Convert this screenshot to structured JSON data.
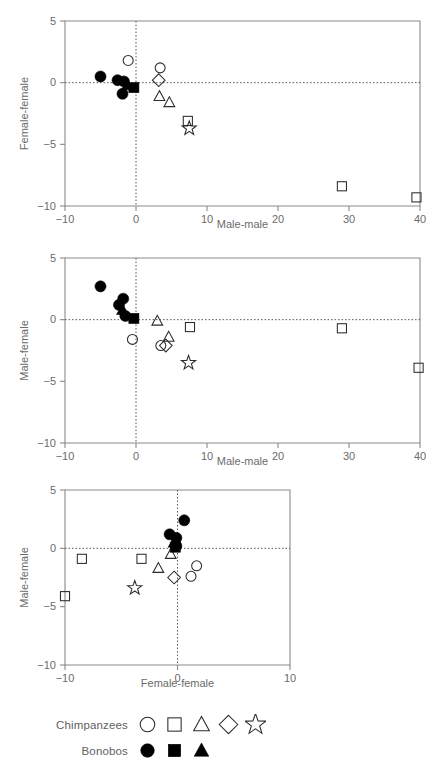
{
  "figure": {
    "axis_ranges": {
      "wide_x": [
        -10,
        40
      ],
      "narrow_x": [
        -10,
        10
      ],
      "y": [
        -10,
        5
      ]
    },
    "wide_x_ticks": [
      "-10",
      "0",
      "10",
      "20",
      "30",
      "40"
    ],
    "narrow_x_ticks": [
      "-10",
      "0",
      "10"
    ],
    "y_ticks": [
      "5",
      "0",
      "-5",
      "-10"
    ],
    "reference_value": "0"
  },
  "legend": {
    "rows": [
      {
        "label": "Chimpanzees",
        "symbols": [
          "open-circle",
          "open-square",
          "open-triangle",
          "open-diamond",
          "open-star"
        ]
      },
      {
        "label": "Bonobos",
        "symbols": [
          "filled-circle",
          "filled-square",
          "filled-triangle"
        ]
      }
    ]
  },
  "chart_data": [
    {
      "type": "scatter",
      "title": "",
      "xlabel": "Male-male",
      "ylabel": "Female-female",
      "xlim": [
        -10,
        40
      ],
      "ylim": [
        -10,
        5
      ],
      "grid": false,
      "reference_lines": {
        "x": 0,
        "y": 0,
        "style": "dotted"
      },
      "legend_position": "figure-bottom",
      "series": [
        {
          "name": "Chimpanzees",
          "marker": "open-circle",
          "points": [
            [
              -1.1,
              1.8
            ],
            [
              3.4,
              1.2
            ]
          ]
        },
        {
          "name": "Chimpanzees",
          "marker": "open-square",
          "points": [
            [
              7.3,
              -3.1
            ],
            [
              29.0,
              -8.4
            ],
            [
              39.5,
              -9.3
            ]
          ]
        },
        {
          "name": "Chimpanzees",
          "marker": "open-triangle",
          "points": [
            [
              3.3,
              -1.1
            ],
            [
              4.7,
              -1.6
            ]
          ]
        },
        {
          "name": "Chimpanzees",
          "marker": "open-diamond",
          "points": [
            [
              3.2,
              0.2
            ]
          ]
        },
        {
          "name": "Chimpanzees",
          "marker": "open-star",
          "points": [
            [
              7.5,
              -3.7
            ]
          ]
        },
        {
          "name": "Bonobos",
          "marker": "filled-circle",
          "points": [
            [
              -5.0,
              0.5
            ],
            [
              -2.6,
              0.2
            ],
            [
              -1.7,
              0.1
            ],
            [
              -1.9,
              -0.9
            ]
          ]
        },
        {
          "name": "Bonobos",
          "marker": "filled-square",
          "points": [
            [
              -0.3,
              -0.4
            ]
          ]
        },
        {
          "name": "Bonobos",
          "marker": "filled-triangle",
          "points": [
            [
              -1.2,
              -0.2
            ]
          ]
        }
      ]
    },
    {
      "type": "scatter",
      "title": "",
      "xlabel": "Male-male",
      "ylabel": "Male-female",
      "xlim": [
        -10,
        40
      ],
      "ylim": [
        -10,
        5
      ],
      "grid": false,
      "reference_lines": {
        "x": 0,
        "y": 0,
        "style": "dotted"
      },
      "legend_position": "figure-bottom",
      "series": [
        {
          "name": "Chimpanzees",
          "marker": "open-circle",
          "points": [
            [
              -0.5,
              -1.6
            ],
            [
              3.5,
              -2.1
            ]
          ]
        },
        {
          "name": "Chimpanzees",
          "marker": "open-square",
          "points": [
            [
              7.6,
              -0.6
            ],
            [
              29.0,
              -0.7
            ],
            [
              39.8,
              -3.9
            ]
          ]
        },
        {
          "name": "Chimpanzees",
          "marker": "open-triangle",
          "points": [
            [
              3.0,
              -0.1
            ],
            [
              4.6,
              -1.4
            ]
          ]
        },
        {
          "name": "Chimpanzees",
          "marker": "open-diamond",
          "points": [
            [
              4.2,
              -2.1
            ]
          ]
        },
        {
          "name": "Chimpanzees",
          "marker": "open-star",
          "points": [
            [
              7.4,
              -3.5
            ]
          ]
        },
        {
          "name": "Bonobos",
          "marker": "filled-circle",
          "points": [
            [
              -5.0,
              2.7
            ],
            [
              -2.4,
              1.2
            ],
            [
              -1.8,
              1.7
            ],
            [
              -1.5,
              0.3
            ]
          ]
        },
        {
          "name": "Bonobos",
          "marker": "filled-square",
          "points": [
            [
              -0.3,
              0.1
            ]
          ]
        },
        {
          "name": "Bonobos",
          "marker": "filled-triangle",
          "points": [
            [
              -1.9,
              0.8
            ]
          ]
        }
      ]
    },
    {
      "type": "scatter",
      "title": "",
      "xlabel": "Female-female",
      "ylabel": "Male-female",
      "xlim": [
        -10,
        10
      ],
      "ylim": [
        -10,
        5
      ],
      "grid": false,
      "reference_lines": {
        "x": 0,
        "y": 0,
        "style": "dotted"
      },
      "legend_position": "figure-bottom",
      "series": [
        {
          "name": "Chimpanzees",
          "marker": "open-circle",
          "points": [
            [
              1.7,
              -1.5
            ],
            [
              1.2,
              -2.4
            ]
          ]
        },
        {
          "name": "Chimpanzees",
          "marker": "open-square",
          "points": [
            [
              -8.5,
              -0.9
            ],
            [
              -10.0,
              -4.1
            ],
            [
              -3.2,
              -0.9
            ]
          ]
        },
        {
          "name": "Chimpanzees",
          "marker": "open-triangle",
          "points": [
            [
              -0.6,
              -0.5
            ],
            [
              -1.7,
              -1.7
            ]
          ]
        },
        {
          "name": "Chimpanzees",
          "marker": "open-diamond",
          "points": [
            [
              -0.3,
              -2.5
            ]
          ]
        },
        {
          "name": "Chimpanzees",
          "marker": "open-star",
          "points": [
            [
              -3.8,
              -3.4
            ]
          ]
        },
        {
          "name": "Bonobos",
          "marker": "filled-circle",
          "points": [
            [
              0.6,
              2.4
            ],
            [
              -0.7,
              1.2
            ],
            [
              -0.1,
              0.9
            ],
            [
              -0.1,
              0.2
            ]
          ]
        },
        {
          "name": "Bonobos",
          "marker": "filled-square",
          "points": [
            [
              -0.2,
              0.1
            ]
          ]
        },
        {
          "name": "Bonobos",
          "marker": "filled-triangle",
          "points": [
            [
              -0.3,
              0.5
            ]
          ]
        }
      ]
    }
  ]
}
